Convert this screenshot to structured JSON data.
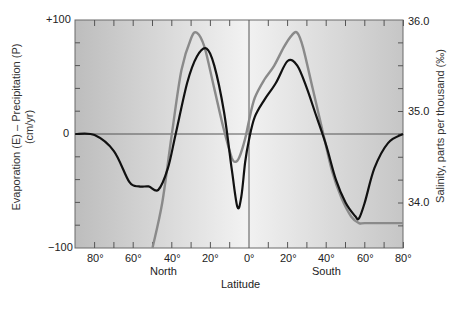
{
  "chart_data": {
    "type": "line",
    "title": "",
    "xlabel": "Latitude",
    "x_group_labels": [
      "North",
      "South"
    ],
    "x_ticks": [
      "80°",
      "60°",
      "40°",
      "20°",
      "0°",
      "20°",
      "40°",
      "60°",
      "80°"
    ],
    "ylabel_left": "Evaporation (E) – Precipitation (P) (cm/yr)",
    "ylabel_left_line1": "Evaporation (E) – Precipitation (P)",
    "ylabel_left_line2": "(cm/yr)",
    "ylabel_right": "Salinity, parts per thousand (‰)",
    "y_left_ticks": [
      "+100",
      "0",
      "−100"
    ],
    "y_right_ticks": [
      "36.0",
      "35.0",
      "34.0"
    ],
    "ylim_left": [
      -100,
      100
    ],
    "ylim_right": [
      33.25,
      36.0
    ],
    "x_range_deg": [
      90,
      -80
    ],
    "x_note": "positive = North latitude, negative = South latitude",
    "grid": false,
    "series": [
      {
        "name": "Evaporation − Precipitation (E−P)",
        "color": "#111111",
        "axis": "left",
        "x": [
          90,
          80,
          70,
          62,
          57,
          52,
          47,
          42,
          38,
          32,
          27,
          22,
          18,
          13,
          9,
          6,
          4,
          2,
          0,
          -3,
          -8,
          -14,
          -20,
          -25,
          -30,
          -35,
          -40,
          -45,
          -50,
          -55,
          -57,
          -60,
          -65,
          -72,
          -80
        ],
        "values": [
          0,
          -1,
          -15,
          -42,
          -46,
          -46,
          -49,
          -30,
          0,
          45,
          68,
          75,
          60,
          20,
          -30,
          -64,
          -55,
          -25,
          -5,
          15,
          30,
          45,
          64,
          60,
          40,
          15,
          -10,
          -40,
          -60,
          -72,
          -74,
          -60,
          -30,
          -8,
          0
        ]
      },
      {
        "name": "Surface salinity",
        "color": "#8a8a8a",
        "axis": "right",
        "x": [
          50,
          45,
          40,
          35,
          30,
          27,
          23,
          18,
          13,
          9,
          7,
          5,
          2,
          0,
          -3,
          -8,
          -13,
          -18,
          -22,
          -25,
          -28,
          -33,
          -38,
          -43,
          -48,
          -53,
          -57,
          -60,
          -70,
          -80
        ],
        "values": [
          33.25,
          34.0,
          34.75,
          35.45,
          35.8,
          35.86,
          35.7,
          35.25,
          34.8,
          34.5,
          34.45,
          34.5,
          34.7,
          34.9,
          35.15,
          35.35,
          35.5,
          35.7,
          35.83,
          35.86,
          35.7,
          35.25,
          34.8,
          34.35,
          34.05,
          33.85,
          33.78,
          33.78,
          33.78,
          33.78
        ]
      }
    ],
    "reference_lines": [
      {
        "type": "horizontal",
        "value": 0,
        "axis": "left"
      },
      {
        "type": "vertical",
        "x": 0
      }
    ],
    "legend": "none"
  }
}
